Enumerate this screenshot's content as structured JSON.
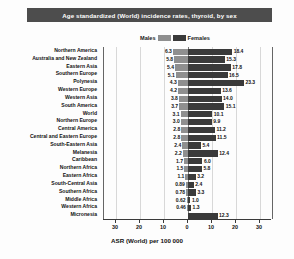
{
  "title": "Age standardized (World) incidence rates, thyroid, by sex",
  "legend": {
    "male_label": "Males",
    "female_label": "Females",
    "male_color": "#8f8f8f",
    "female_color": "#3a3a3a"
  },
  "axis": {
    "title": "ASR (World) per 100 000",
    "ticks": [
      "30",
      "20",
      "10",
      "0",
      "10",
      "20",
      "30"
    ],
    "tick_values": [
      -30,
      -20,
      -10,
      0,
      10,
      20,
      30
    ],
    "min": -35,
    "max": 35
  },
  "chart_data": {
    "type": "bar",
    "title": "Age standardized (World) incidence rates, thyroid, by sex",
    "xlabel": "ASR (World) per 100 000",
    "ylabel": "",
    "orientation": "horizontal",
    "layout": "diverging-population-pyramid",
    "xlim": [
      -35,
      35
    ],
    "grid": true,
    "legend_position": "top-center",
    "categories": [
      "Northern America",
      "Australia and New Zealand",
      "Eastern Asia",
      "Southern Europe",
      "Polynesia",
      "Western Europe",
      "Western Asia",
      "South America",
      "World",
      "Northern Europe",
      "Central America",
      "Central and Eastern Europe",
      "South-Eastern Asia",
      "Melanesia",
      "Caribbean",
      "Northern Africa",
      "Eastern Africa",
      "South-Central Asia",
      "Southern Africa",
      "Middle Africa",
      "Western Africa",
      "Micronesia"
    ],
    "series": [
      {
        "name": "Males",
        "color": "#8f8f8f",
        "side": "left",
        "values": [
          6.3,
          5.8,
          5.4,
          5.1,
          4.3,
          4.2,
          3.8,
          3.7,
          3.1,
          3.0,
          2.8,
          2.8,
          2.4,
          2.2,
          1.7,
          1.5,
          1.1,
          0.89,
          0.78,
          0.62,
          0.46,
          0
        ]
      },
      {
        "name": "Females",
        "color": "#3a3a3a",
        "side": "right",
        "values": [
          18.4,
          15.3,
          17.8,
          16.5,
          23.3,
          13.6,
          14.0,
          15.1,
          10.1,
          9.9,
          11.2,
          11.5,
          5.4,
          12.4,
          6.0,
          5.8,
          3.2,
          2.4,
          3.3,
          1.0,
          1.3,
          12.3
        ]
      }
    ],
    "male_labels": [
      "6.3",
      "5.8",
      "5.4",
      "5.1",
      "4.3",
      "4.2",
      "3.8",
      "3.7",
      "3.1",
      "3.0",
      "2.8",
      "2.8",
      "2.4",
      "2.2",
      "1.7",
      "1.5",
      "1.1",
      "0.89",
      "0.78",
      "0.62",
      "0.46",
      ""
    ],
    "female_labels": [
      "18.4",
      "15.3",
      "17.8",
      "16.5",
      "23.3",
      "13.6",
      "14.0",
      "15.1",
      "10.1",
      "9.9",
      "11.2",
      "11.5",
      "5.4",
      "12.4",
      "6.0",
      "5.8",
      "3.2",
      "2.4",
      "3.3",
      "1.0",
      "1.3",
      "12.3"
    ]
  }
}
